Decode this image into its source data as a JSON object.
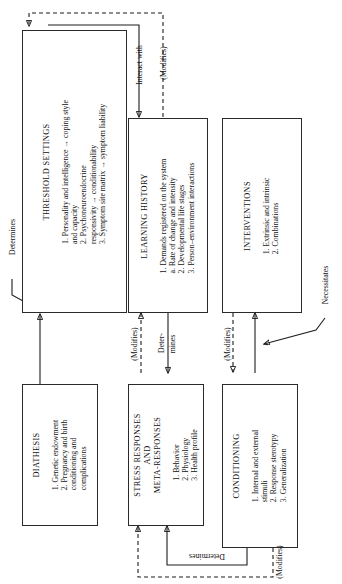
{
  "diagram": {
    "orientation": "text rotated 90 degrees counter-clockwise"
  },
  "boxes": {
    "threshold_settings": {
      "title": "THRESHOLD SETTINGS",
      "items": [
        "1. Personality and intelligence → coping style",
        "    and capacity",
        "2. Psychoneuroendocrine",
        "    responsivity → conditionability",
        "3. Symptom site matrix → symptom liability"
      ]
    },
    "learning_history": {
      "title": "LEARNING HISTORY",
      "items": [
        "1. Demands registered on the system",
        "    a. Rate of change and intensity",
        "2. Developmental life stages",
        "3. Person–environment interactions"
      ]
    },
    "interventions": {
      "title": "INTERVENTIONS",
      "items": [
        "1. Extrinsic and intrinsic",
        "2. Combinations"
      ]
    },
    "diathesis": {
      "title": "DIATHESIS",
      "items": [
        "1. Genetic endowment",
        "2. Pregnancy and birth",
        "    conditioning and",
        "    complications"
      ]
    },
    "stress_responses": {
      "title": "STRESS RESPONSES\nAND\nMETA-RESPONSES",
      "title_line1": "STRESS RESPONSES",
      "title_line2": "AND",
      "title_line3": "META-RESPONSES",
      "items": [
        "1. Behavior",
        "2. Physiology",
        "3. Health profile"
      ]
    },
    "conditioning": {
      "title": "CONDITIONING",
      "items": [
        "1. Internal and external",
        "    stimuli",
        "2. Response sterotypy",
        "3. Generalization"
      ]
    }
  },
  "edge_labels": {
    "determines_left": "Determines",
    "interact_with": "Interact with",
    "modifies_top": "(Modifies)",
    "modifies_learning": "(Modifies)",
    "determines_learning_line1": "Deter-",
    "determines_learning_line2": "mines",
    "modifies_conditioning": "(Modifies)",
    "necessitates": "Necessitates",
    "determines_bottom": "Determines",
    "modifies_bottom": "(Modifies)"
  },
  "colors": {
    "stroke": "#1d1d1d",
    "background": "#ffffff",
    "text": "#111111"
  }
}
